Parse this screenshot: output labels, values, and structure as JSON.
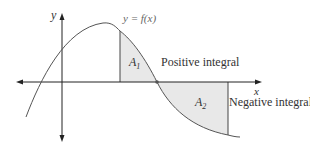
{
  "diagram": {
    "curve_label": "y = f(x)",
    "x_axis_label": "x",
    "y_axis_label": "y",
    "regions": [
      {
        "label": "A",
        "subscript": "1",
        "annotation": "Positive integral",
        "fill": "#e8e8e8"
      },
      {
        "label": "A",
        "subscript": "2",
        "annotation": "Negative integral",
        "fill": "#e8e8e8"
      }
    ],
    "colors": {
      "axis": "#222222",
      "curve": "#444444",
      "shade": "#e8e8e8",
      "root_dot": "#555555"
    }
  }
}
